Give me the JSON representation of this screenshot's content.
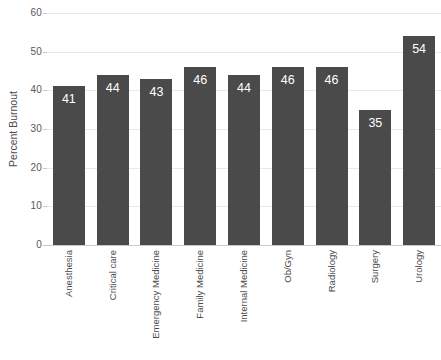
{
  "chart_data": {
    "type": "bar",
    "title": "",
    "xlabel": "",
    "ylabel": "Percent Burnout",
    "ylim": [
      0,
      60
    ],
    "ytick_values": [
      0,
      10,
      20,
      30,
      40,
      50,
      60
    ],
    "ytick_labels": [
      "0",
      "10",
      "20",
      "30",
      "40",
      "50",
      "60"
    ],
    "grid": true,
    "legend": false,
    "categories": [
      "Anesthesia",
      "Critical care",
      "Emergency Medicine",
      "Family Medicine",
      "Internal Medicine",
      "Ob/Gyn",
      "Radiology",
      "Surgery",
      "Urology"
    ],
    "values": [
      41,
      44,
      43,
      46,
      44,
      46,
      46,
      35,
      54
    ],
    "data_labels": [
      "41",
      "44",
      "43",
      "46",
      "44",
      "46",
      "46",
      "35",
      "54"
    ],
    "bar_color": "#4a4a4a",
    "data_label_color": "#ffffff",
    "gridline_color": "#e9e9ec",
    "axis_text_color": "#4b4b4e",
    "background_color": "#ffffff"
  }
}
